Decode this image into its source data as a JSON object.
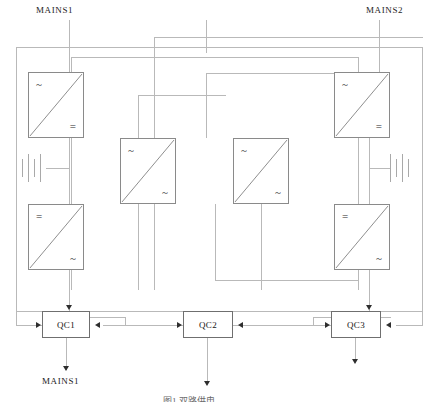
{
  "diagram": {
    "title_caption": "图1  双路供电",
    "labels": {
      "mains1_top": "MAINS1",
      "mains2_top": "MAINS2",
      "mains1_bottom": "MAINS1"
    },
    "converters": [
      {
        "id": "rectifier-left",
        "input_symbol": "~",
        "output_symbol": "="
      },
      {
        "id": "inverter-left",
        "input_symbol": "=",
        "output_symbol": "~"
      },
      {
        "id": "converter-mid-left",
        "input_symbol": "~",
        "output_symbol": "~"
      },
      {
        "id": "converter-mid-right",
        "input_symbol": "~",
        "output_symbol": "~"
      },
      {
        "id": "rectifier-right",
        "input_symbol": "~",
        "output_symbol": "="
      },
      {
        "id": "inverter-right",
        "input_symbol": "=",
        "output_symbol": "~"
      }
    ],
    "switches": [
      {
        "id": "qc1",
        "label": "QC1"
      },
      {
        "id": "qc2",
        "label": "QC2"
      },
      {
        "id": "qc3",
        "label": "QC3"
      }
    ],
    "colors": {
      "wire": "#b9b9b9",
      "wire_dark": "#8d8d8d",
      "box_border": "#8a8a8a",
      "switch_border": "#6f6f6f",
      "arrow": "#2e2e2e",
      "text": "#1c1c1c",
      "background": "#ffffff"
    }
  }
}
